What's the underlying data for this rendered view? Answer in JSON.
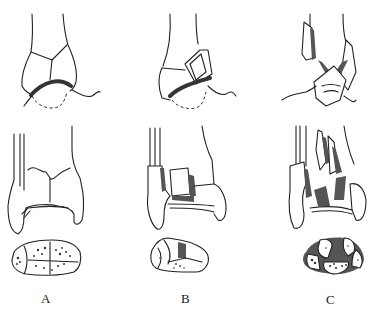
{
  "figure": {
    "panels": [
      {
        "id": "A",
        "label": "A",
        "description": "Malleolar fracture with intact articular surface; distal tibia coronal view and axial plafond view with comminution"
      },
      {
        "id": "B",
        "label": "B",
        "description": "Plafond fracture with displaced articular fragment; coronal view and axial view"
      },
      {
        "id": "C",
        "label": "C",
        "description": "Highly comminuted pilon fracture with impaction; coronal view and axial view"
      }
    ],
    "colors": {
      "line": "#222222",
      "shade": "#555555",
      "background": "#ffffff"
    }
  }
}
